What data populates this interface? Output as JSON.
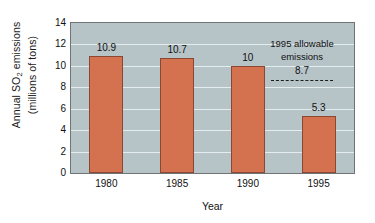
{
  "chart_data": {
    "type": "bar",
    "title": "",
    "categories": [
      "1980",
      "1985",
      "1990",
      "1995"
    ],
    "values": [
      10.9,
      10.7,
      10,
      5.3
    ],
    "value_labels": [
      "10.9",
      "10.7",
      "10",
      "5.3"
    ],
    "series": [
      {
        "name": "Annual SO2 emissions",
        "values": [
          10.9,
          10.7,
          10,
          5.3
        ]
      }
    ],
    "xlabel": "Year",
    "ylabel": "Annual SO2 emissions (millions of tons)",
    "ylabel_line1_prefix": "Annual SO",
    "ylabel_line1_subscript": "2",
    "ylabel_line1_suffix": " emissions",
    "ylabel_line2": "(millions of tons)",
    "ylim": [
      0,
      14
    ],
    "yticks": [
      0,
      2,
      4,
      6,
      8,
      10,
      12,
      14
    ],
    "ytick_labels": [
      "0",
      "2",
      "4",
      "6",
      "8",
      "10",
      "12",
      "14"
    ],
    "grid": true,
    "grid_axis": "y",
    "legend": false,
    "annotations": [
      {
        "name": "allowable-emissions",
        "text_line1": "1995 allowable",
        "text_line2": "emissions",
        "value": 8.7,
        "value_label": "8.7",
        "line_style": "dashed"
      }
    ],
    "colors": {
      "bar_fill": "#d4714e",
      "bar_border": "#8c4733",
      "plot_background": "#b6c3c7",
      "gridline": "#e4ecee",
      "axis_border": "#6f7476",
      "text": "#111111",
      "page_background": "#ffffff",
      "annotation_line": "#1d1d1d"
    }
  }
}
